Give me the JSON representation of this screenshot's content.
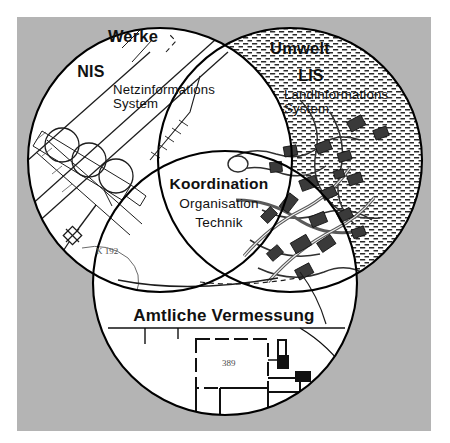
{
  "figure": {
    "type": "venn-diagram",
    "circle_count": 3,
    "background_color": "#b4b4b4",
    "fill_color": "#ffffff",
    "stroke_color": "#000000"
  },
  "labels": {
    "werke": "Werke",
    "nis_abbrev": "NIS",
    "nis_line1": "Netzinformations",
    "nis_line2": "System",
    "umwelt": "Umwelt",
    "lis_abbrev": "LIS",
    "lis_line1": "Landinformations",
    "lis_line2": "System",
    "koordination": "Koordination",
    "organisation": "Organisation",
    "technik": "Technik",
    "amtliche_vermessung": "Amtliche Vermessung"
  },
  "map_annotations": {
    "nis_road_label": "K  192",
    "parcel_number": "389"
  }
}
